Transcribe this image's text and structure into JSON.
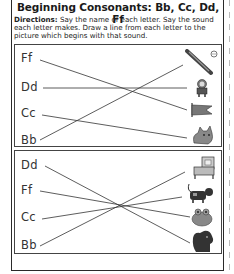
{
  "worksheet": {
    "title": "Beginning Consonants: Bb, Cc, Dd, Ff",
    "directions_label": "Directions:",
    "directions_text": " Say the name of each letter. Say the sound each letter makes. Draw a line from each letter to the picture which begins with that sound."
  },
  "sections": [
    {
      "letters": [
        "Ff",
        "Dd",
        "Cc",
        "Bb"
      ],
      "pictures": [
        "bat",
        "doll",
        "flag",
        "cat"
      ]
    },
    {
      "letters": [
        "Dd",
        "Ff",
        "Cc",
        "Bb"
      ],
      "pictures": [
        "bed",
        "cow",
        "frog",
        "dog"
      ]
    }
  ],
  "colors": {
    "border": "#2a2a2a",
    "line": "#333333",
    "text": "#222222"
  }
}
